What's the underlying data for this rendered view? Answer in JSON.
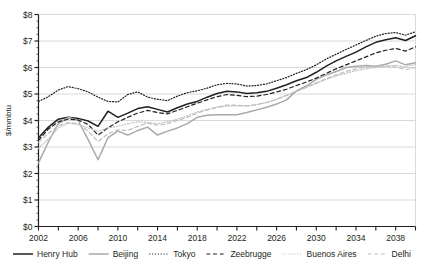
{
  "chart_data": {
    "type": "line",
    "title": "",
    "xlabel": "",
    "ylabel": "$/mmbtu",
    "xlim": [
      2002,
      2040
    ],
    "ylim": [
      0,
      8
    ],
    "ytick_labels": [
      "$0",
      "$1",
      "$2",
      "$3",
      "$4",
      "$5",
      "$6",
      "$7",
      "$8"
    ],
    "ytick_values": [
      0,
      1,
      2,
      3,
      4,
      5,
      6,
      7,
      8
    ],
    "xtick_labels": [
      "2002",
      "2006",
      "2010",
      "2014",
      "2018",
      "2022",
      "2026",
      "2030",
      "2034",
      "2038"
    ],
    "xtick_values": [
      2002,
      2006,
      2010,
      2014,
      2018,
      2022,
      2026,
      2030,
      2034,
      2038
    ],
    "xminor_values": [
      2004,
      2008,
      2012,
      2016,
      2020,
      2024,
      2028,
      2032,
      2036,
      2040
    ],
    "grid": "horizontal",
    "legend_position": "bottom",
    "x": [
      2002,
      2003,
      2004,
      2005,
      2006,
      2007,
      2008,
      2009,
      2010,
      2011,
      2012,
      2013,
      2014,
      2015,
      2016,
      2017,
      2018,
      2019,
      2020,
      2021,
      2022,
      2023,
      2024,
      2025,
      2026,
      2027,
      2028,
      2029,
      2030,
      2031,
      2032,
      2033,
      2034,
      2035,
      2036,
      2037,
      2038,
      2039,
      2040
    ],
    "series": [
      {
        "name": "Henry Hub",
        "color": "#231f20",
        "style": "solid",
        "width": 1.5,
        "values": [
          3.35,
          3.75,
          4.05,
          4.12,
          4.08,
          3.98,
          3.78,
          4.35,
          4.12,
          4.28,
          4.45,
          4.52,
          4.42,
          4.32,
          4.48,
          4.62,
          4.72,
          4.88,
          5.02,
          5.1,
          5.08,
          5.02,
          5.05,
          5.1,
          5.22,
          5.35,
          5.5,
          5.62,
          5.82,
          6.05,
          6.25,
          6.42,
          6.58,
          6.78,
          6.95,
          7.05,
          7.12,
          7.02,
          7.2
        ]
      },
      {
        "name": "Beijing",
        "color": "#a7a9ac",
        "style": "solid",
        "width": 1.5,
        "values": [
          2.4,
          3.2,
          3.88,
          4.12,
          4.0,
          3.28,
          2.52,
          3.35,
          3.6,
          3.45,
          3.62,
          3.75,
          3.45,
          3.6,
          3.72,
          3.88,
          4.12,
          4.2,
          4.22,
          4.22,
          4.22,
          4.3,
          4.4,
          4.5,
          4.62,
          4.78,
          5.12,
          5.3,
          5.55,
          5.72,
          5.85,
          6.0,
          6.05,
          6.08,
          6.05,
          6.12,
          6.25,
          6.1,
          6.18
        ]
      },
      {
        "name": "Tokyo",
        "color": "#231f20",
        "style": "dotted",
        "width": 1.2,
        "values": [
          4.72,
          4.9,
          5.15,
          5.28,
          5.2,
          5.08,
          4.88,
          4.72,
          4.7,
          4.98,
          5.08,
          4.88,
          4.8,
          4.75,
          4.92,
          5.05,
          5.12,
          5.22,
          5.35,
          5.4,
          5.38,
          5.3,
          5.32,
          5.38,
          5.5,
          5.62,
          5.78,
          5.92,
          6.1,
          6.32,
          6.5,
          6.68,
          6.85,
          7.02,
          7.18,
          7.28,
          7.32,
          7.22,
          7.35
        ]
      },
      {
        "name": "Zeebrugge",
        "color": "#231f20",
        "style": "dashed",
        "width": 1.2,
        "values": [
          3.25,
          3.68,
          3.95,
          4.05,
          4.02,
          3.85,
          3.45,
          3.72,
          3.95,
          4.12,
          4.28,
          4.38,
          4.3,
          4.25,
          4.38,
          4.52,
          4.65,
          4.78,
          4.9,
          4.98,
          4.95,
          4.9,
          4.92,
          4.98,
          5.08,
          5.18,
          5.32,
          5.45,
          5.6,
          5.78,
          5.95,
          6.1,
          6.25,
          6.4,
          6.55,
          6.65,
          6.72,
          6.62,
          6.78
        ]
      },
      {
        "name": "Buenos Aires",
        "color": "#bcbec0",
        "style": "dotted",
        "width": 1.2,
        "values": [
          2.95,
          3.3,
          3.72,
          3.9,
          3.85,
          3.72,
          3.6,
          3.72,
          3.78,
          3.88,
          3.95,
          3.92,
          3.88,
          3.95,
          4.05,
          4.18,
          4.32,
          4.42,
          4.5,
          4.55,
          4.55,
          4.55,
          4.6,
          4.68,
          4.8,
          4.95,
          5.1,
          5.25,
          5.4,
          5.55,
          5.68,
          5.78,
          5.88,
          5.95,
          6.0,
          6.05,
          6.08,
          6.02,
          6.12
        ]
      },
      {
        "name": "Delhi",
        "color": "#bcbec0",
        "style": "dashed",
        "width": 1.2,
        "values": [
          3.18,
          3.52,
          3.8,
          3.92,
          3.88,
          3.6,
          3.2,
          3.5,
          3.65,
          3.62,
          3.78,
          3.9,
          3.82,
          3.88,
          4.0,
          4.12,
          4.28,
          4.4,
          4.5,
          4.58,
          4.58,
          4.55,
          4.6,
          4.68,
          4.8,
          4.95,
          5.1,
          5.25,
          5.42,
          5.58,
          5.72,
          5.85,
          5.95,
          6.02,
          6.05,
          6.05,
          6.02,
          5.92,
          6.0
        ]
      }
    ]
  },
  "legend": {
    "items": [
      {
        "label": "Henry Hub"
      },
      {
        "label": "Beijing"
      },
      {
        "label": "Tokyo"
      },
      {
        "label": "Zeebrugge"
      },
      {
        "label": "Buenos Aires"
      },
      {
        "label": "Delhi"
      }
    ]
  },
  "axes": {
    "y_title": "$/mmbtu"
  },
  "colors": {
    "axis": "#231f20",
    "grid": "#d9d9d9",
    "series_dark": "#231f20",
    "series_gray": "#a7a9ac",
    "series_light_gray": "#bcbec0",
    "background": "#ffffff"
  }
}
